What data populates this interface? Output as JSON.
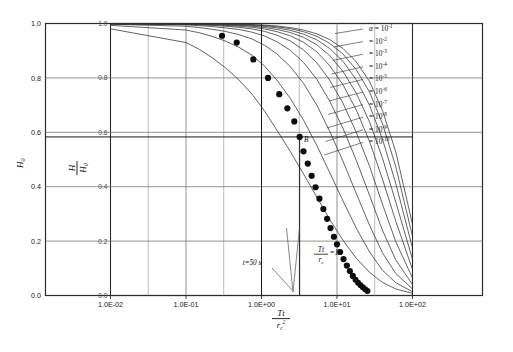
{
  "figure": {
    "title": "",
    "caption": ""
  },
  "axes": {
    "x_tick_labels": [
      "1.0E-02",
      "1.0E-01",
      "1.0E+00",
      "1.0E+01",
      "1.0E+02"
    ],
    "y_tick_labels": [
      "0.0",
      "0.2",
      "0.4",
      "0.6",
      "0.8",
      "1.0"
    ],
    "y_inner_tick_labels": [
      "0.0",
      "0.2",
      "0.4",
      "0.6",
      "0.8",
      "1.0"
    ],
    "y_outer_axis_label": "H",
    "y_outer_axis_label_sub": "0",
    "y_inner_label_num": "H",
    "y_inner_label_den": "H",
    "y_inner_label_den_sub": "0",
    "x_axis_label_num": "Tt",
    "x_axis_label_den": "r",
    "x_axis_label_den_sub": "c",
    "x_axis_label_den_sup": "2"
  },
  "legend": {
    "symbol": "α",
    "equals": "=",
    "entries": [
      {
        "mantissa": "10",
        "exponent": "-1"
      },
      {
        "mantissa": "10",
        "exponent": "-2"
      },
      {
        "mantissa": "10",
        "exponent": "-3"
      },
      {
        "mantissa": "10",
        "exponent": "-4"
      },
      {
        "mantissa": "10",
        "exponent": "-5"
      },
      {
        "mantissa": "10",
        "exponent": "-6"
      },
      {
        "mantissa": "10",
        "exponent": "-7"
      },
      {
        "mantissa": "10",
        "exponent": "-8"
      },
      {
        "mantissa": "10",
        "exponent": "-9"
      },
      {
        "mantissa": "10",
        "exponent": "-10"
      }
    ]
  },
  "annotations": {
    "match_point_label": "B",
    "time_label": "t=50  s",
    "ratio_label_num": "Tt",
    "ratio_label_den": "r",
    "ratio_label_den_sub": "c",
    "ratio_label_equals": "=1"
  },
  "chart_data": {
    "type": "line",
    "title": "",
    "xlabel": "Tt/rc^2",
    "ylabel": "H/H0",
    "xscale": "log",
    "xlim": [
      0.01,
      100
    ],
    "ylim": [
      0.0,
      1.0
    ],
    "grid": true,
    "legend_position": "right-inside",
    "x_major_ticks": [
      0.01,
      0.1,
      1,
      10,
      100
    ],
    "y_major_ticks": [
      0.0,
      0.2,
      0.4,
      0.6,
      0.8,
      1.0
    ],
    "series": [
      {
        "name": "alpha = 1e-1",
        "x": [
          0.1,
          0.15,
          0.22,
          0.33,
          0.5,
          0.75,
          1.1,
          1.6,
          2.4,
          3.6,
          5.4,
          8.0,
          12.0,
          18.0,
          27.0,
          40.0,
          60.0,
          100.0
        ],
        "y": [
          0.93,
          0.905,
          0.875,
          0.838,
          0.793,
          0.74,
          0.678,
          0.608,
          0.53,
          0.447,
          0.362,
          0.28,
          0.203,
          0.137,
          0.085,
          0.048,
          0.024,
          0.008
        ]
      },
      {
        "name": "alpha = 1e-2",
        "x": [
          0.1,
          0.15,
          0.22,
          0.33,
          0.5,
          0.75,
          1.1,
          1.6,
          2.4,
          3.6,
          5.4,
          8.0,
          12.0,
          18.0,
          27.0,
          40.0,
          60.0,
          100.0
        ],
        "y": [
          0.976,
          0.966,
          0.953,
          0.936,
          0.913,
          0.883,
          0.843,
          0.792,
          0.725,
          0.645,
          0.552,
          0.452,
          0.348,
          0.248,
          0.16,
          0.093,
          0.047,
          0.014
        ]
      },
      {
        "name": "alpha = 1e-3",
        "x": [
          0.1,
          0.15,
          0.22,
          0.33,
          0.5,
          0.75,
          1.1,
          1.6,
          2.4,
          3.6,
          5.4,
          8.0,
          12.0,
          18.0,
          27.0,
          40.0,
          60.0,
          100.0
        ],
        "y": [
          0.99,
          0.985,
          0.979,
          0.971,
          0.959,
          0.943,
          0.92,
          0.888,
          0.842,
          0.78,
          0.7,
          0.604,
          0.494,
          0.375,
          0.258,
          0.157,
          0.081,
          0.024
        ]
      },
      {
        "name": "alpha = 1e-4",
        "x": [
          0.1,
          0.15,
          0.22,
          0.33,
          0.5,
          0.75,
          1.1,
          1.6,
          2.4,
          3.6,
          5.4,
          8.0,
          12.0,
          18.0,
          27.0,
          40.0,
          60.0,
          100.0
        ],
        "y": [
          0.995,
          0.992,
          0.989,
          0.984,
          0.978,
          0.968,
          0.954,
          0.933,
          0.902,
          0.857,
          0.795,
          0.715,
          0.615,
          0.497,
          0.368,
          0.24,
          0.131,
          0.04
        ]
      },
      {
        "name": "alpha = 1e-5",
        "x": [
          0.1,
          0.15,
          0.22,
          0.33,
          0.5,
          0.75,
          1.1,
          1.6,
          2.4,
          3.6,
          5.4,
          8.0,
          12.0,
          18.0,
          27.0,
          40.0,
          60.0,
          100.0
        ],
        "y": [
          0.997,
          0.995,
          0.993,
          0.99,
          0.986,
          0.98,
          0.971,
          0.957,
          0.936,
          0.903,
          0.856,
          0.792,
          0.707,
          0.6,
          0.475,
          0.336,
          0.198,
          0.064
        ]
      },
      {
        "name": "alpha = 1e-6",
        "x": [
          0.1,
          0.15,
          0.22,
          0.33,
          0.5,
          0.75,
          1.1,
          1.6,
          2.4,
          3.6,
          5.4,
          8.0,
          12.0,
          18.0,
          27.0,
          40.0,
          60.0,
          100.0
        ],
        "y": [
          0.998,
          0.997,
          0.995,
          0.993,
          0.99,
          0.986,
          0.98,
          0.97,
          0.955,
          0.931,
          0.896,
          0.845,
          0.775,
          0.682,
          0.566,
          0.428,
          0.273,
          0.096
        ]
      },
      {
        "name": "alpha = 1e-7",
        "x": [
          0.1,
          0.15,
          0.22,
          0.33,
          0.5,
          0.75,
          1.1,
          1.6,
          2.4,
          3.6,
          5.4,
          8.0,
          12.0,
          18.0,
          27.0,
          40.0,
          60.0,
          100.0
        ],
        "y": [
          0.999,
          0.998,
          0.997,
          0.995,
          0.993,
          0.99,
          0.985,
          0.978,
          0.967,
          0.949,
          0.922,
          0.882,
          0.824,
          0.744,
          0.638,
          0.505,
          0.344,
          0.133
        ]
      },
      {
        "name": "alpha = 1e-8",
        "x": [
          0.1,
          0.15,
          0.22,
          0.33,
          0.5,
          0.75,
          1.1,
          1.6,
          2.4,
          3.6,
          5.4,
          8.0,
          12.0,
          18.0,
          27.0,
          40.0,
          60.0,
          100.0
        ],
        "y": [
          0.999,
          0.999,
          0.998,
          0.997,
          0.995,
          0.993,
          0.989,
          0.984,
          0.975,
          0.961,
          0.94,
          0.908,
          0.861,
          0.793,
          0.699,
          0.575,
          0.412,
          0.175
        ]
      },
      {
        "name": "alpha = 1e-9",
        "x": [
          0.1,
          0.15,
          0.22,
          0.33,
          0.5,
          0.75,
          1.1,
          1.6,
          2.4,
          3.6,
          5.4,
          8.0,
          12.0,
          18.0,
          27.0,
          40.0,
          60.0,
          100.0
        ],
        "y": [
          0.999,
          0.999,
          0.999,
          0.998,
          0.997,
          0.995,
          0.992,
          0.988,
          0.981,
          0.97,
          0.953,
          0.927,
          0.888,
          0.83,
          0.748,
          0.632,
          0.474,
          0.218
        ]
      },
      {
        "name": "alpha = 1e-10",
        "x": [
          0.1,
          0.15,
          0.22,
          0.33,
          0.5,
          0.75,
          1.1,
          1.6,
          2.4,
          3.6,
          5.4,
          8.0,
          12.0,
          18.0,
          27.0,
          40.0,
          60.0,
          100.0
        ],
        "y": [
          1.0,
          0.999,
          0.999,
          0.999,
          0.998,
          0.996,
          0.994,
          0.991,
          0.985,
          0.976,
          0.962,
          0.941,
          0.908,
          0.859,
          0.787,
          0.68,
          0.528,
          0.262
        ]
      }
    ],
    "observed_points": {
      "name": "Field data",
      "marker": "filled-circle",
      "x": [
        0.3,
        0.47,
        0.78,
        1.22,
        1.72,
        2.2,
        2.72,
        3.2,
        3.6,
        4.1,
        4.62,
        5.2,
        5.85,
        6.6,
        7.4,
        8.2,
        9.1,
        10.0,
        11.0,
        12.2,
        13.5,
        14.8,
        16.2
      ],
      "y": [
        0.955,
        0.93,
        0.868,
        0.8,
        0.74,
        0.688,
        0.64,
        0.583,
        0.53,
        0.485,
        0.44,
        0.398,
        0.356,
        0.318,
        0.282,
        0.248,
        0.216,
        0.188,
        0.16,
        0.134,
        0.11,
        0.09,
        0.072
      ]
    },
    "match_point": {
      "label": "B",
      "x": 3.2,
      "y": 0.583
    },
    "reference_lines": [
      {
        "orientation": "horizontal",
        "value": 0.583,
        "label": "B level"
      },
      {
        "orientation": "vertical",
        "value": 1.0,
        "label": "Tt/rc^2 = 1"
      }
    ]
  }
}
